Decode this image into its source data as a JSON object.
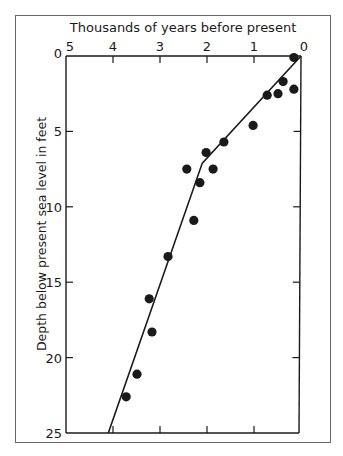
{
  "chart_data": {
    "type": "scatter",
    "title": "",
    "xlabel": "Thousands of years before present",
    "ylabel": "Depth below present sea level in feet",
    "x_axis_position": "top",
    "x_reversed": true,
    "y_reversed": true,
    "xlim": [
      5,
      0
    ],
    "ylim": [
      0,
      25
    ],
    "x_ticks": [
      5,
      4,
      3,
      2,
      1,
      0
    ],
    "y_ticks": [
      0,
      5,
      10,
      15,
      20,
      25
    ],
    "grid": false,
    "legend": null,
    "series": [
      {
        "name": "Observations",
        "kind": "scatter",
        "points": [
          {
            "x": 0.15,
            "y": 0.1
          },
          {
            "x": 0.38,
            "y": 1.7
          },
          {
            "x": 0.15,
            "y": 2.2
          },
          {
            "x": 0.49,
            "y": 2.5
          },
          {
            "x": 0.72,
            "y": 2.6
          },
          {
            "x": 1.02,
            "y": 4.6
          },
          {
            "x": 1.64,
            "y": 5.7
          },
          {
            "x": 2.02,
            "y": 6.4
          },
          {
            "x": 2.43,
            "y": 7.5
          },
          {
            "x": 1.87,
            "y": 7.5
          },
          {
            "x": 2.15,
            "y": 8.4
          },
          {
            "x": 2.28,
            "y": 10.9
          },
          {
            "x": 2.83,
            "y": 13.3
          },
          {
            "x": 3.23,
            "y": 16.1
          },
          {
            "x": 3.17,
            "y": 18.3
          },
          {
            "x": 3.49,
            "y": 21.1
          },
          {
            "x": 3.72,
            "y": 22.6
          }
        ]
      },
      {
        "name": "Sea-level rise curve",
        "kind": "line",
        "points": [
          {
            "x": 0.0,
            "y": 0.0
          },
          {
            "x": 2.1,
            "y": 7.1
          },
          {
            "x": 4.1,
            "y": 25.0
          }
        ]
      }
    ]
  },
  "labels": {
    "x_title": "Thousands of years before present",
    "y_title": "Depth below present sea level in feet",
    "x_tick_labels": [
      "5",
      "4",
      "3",
      "2",
      "1",
      "0"
    ],
    "y_tick_labels": [
      "0",
      "5",
      "10",
      "15",
      "20",
      "25"
    ]
  },
  "colors": {
    "ink": "#1a1a1a",
    "frame": "#555555",
    "background": "#ffffff"
  }
}
